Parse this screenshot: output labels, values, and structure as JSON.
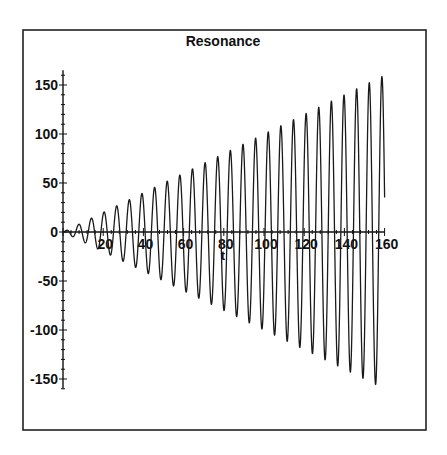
{
  "chart_data": {
    "type": "line",
    "title": "Resonance",
    "xlabel": "t",
    "ylabel": "",
    "function": "t*sin(t)",
    "xlim": [
      0,
      160
    ],
    "ylim": [
      -160,
      165
    ],
    "grid": false,
    "legend": null,
    "x_ticks": [
      20,
      40,
      60,
      80,
      100,
      120,
      140,
      160
    ],
    "x_tick_labels": [
      "20",
      "40",
      "60",
      "80",
      "100",
      "120",
      "140",
      "160"
    ],
    "y_ticks": [
      150,
      100,
      50,
      0,
      -50,
      -100,
      -150
    ],
    "y_tick_labels": [
      "150",
      "100",
      "50",
      "0",
      "-50",
      "-100",
      "-150"
    ],
    "series": [
      {
        "name": "t*sin(t)",
        "color": "#1a1a1a",
        "envelope": "amplitude grows linearly with t (peaks ≈ ±t)",
        "sample_points": [
          {
            "x": 0,
            "y": 0
          },
          {
            "x": 7.85,
            "y": 7.85
          },
          {
            "x": 20.42,
            "y": 20.42
          },
          {
            "x": 39.27,
            "y": 39.27
          },
          {
            "x": 58.12,
            "y": 58.12
          },
          {
            "x": 77.0,
            "y": 77.0
          },
          {
            "x": 102.1,
            "y": 102.1
          },
          {
            "x": 120.9,
            "y": 120.9
          },
          {
            "x": 139.8,
            "y": 139.8
          },
          {
            "x": 158.65,
            "y": 158.65
          },
          {
            "x": 155.5,
            "y": -155.5
          },
          {
            "x": 160,
            "y": 35
          }
        ]
      }
    ]
  },
  "layout": {
    "frame": {
      "left": 23,
      "top": 30,
      "right": 426,
      "bottom": 430
    },
    "origin_px": {
      "x": 63,
      "y": 232
    },
    "px_per_x": 2.01,
    "px_per_y": 0.98
  }
}
